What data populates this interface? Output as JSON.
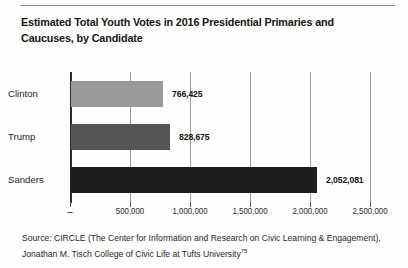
{
  "figure": {
    "title": "Estimated Total Youth Votes in 2016 Presidential Primaries and Caucuses, by Candidate",
    "source_prefix": "Source: CIRCLE (The Center for Information and Research on Civic Learning & Engagement), Jonathan M. Tisch College of Civic Life at Tufts University",
    "source_footnote": "75"
  },
  "chart_data": {
    "type": "bar",
    "orientation": "horizontal",
    "title": "Estimated Total Youth Votes in 2016 Presidential Primaries and Caucuses, by Candidate",
    "xlabel": "",
    "ylabel": "",
    "categories": [
      "Clinton",
      "Trump",
      "Sanders"
    ],
    "values": [
      766425,
      828675,
      2052081
    ],
    "value_labels": [
      "766,425",
      "828,675",
      "2,052,081"
    ],
    "bar_colors": [
      "#9a9a9a",
      "#555555",
      "#1c1c1c"
    ],
    "xlim": [
      0,
      2500000
    ],
    "xticks": [
      0,
      500000,
      1000000,
      1500000,
      2000000,
      2500000
    ],
    "xtick_labels": [
      "–",
      "500,000",
      "1,000,000",
      "1,500,000",
      "2,000,000",
      "2,500,000"
    ],
    "grid": "vertical",
    "legend": "none"
  }
}
